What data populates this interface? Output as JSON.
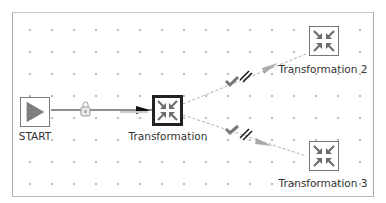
{
  "diagram": {
    "type": "pipeline-flow",
    "colors": {
      "canvas_border": "#b0b0b0",
      "grid_dot": "#b8b8b8",
      "node_border": "#777777",
      "selected_border": "#222222",
      "icon_gray": "#6e6e6e",
      "start_arrow": "#7d7d7d",
      "hop_line": "#222222",
      "hop_dashed": "#b0b0b0",
      "label_text": "#333333"
    },
    "nodes": [
      {
        "id": "start",
        "label": "START",
        "icon": "play-icon",
        "selected": false
      },
      {
        "id": "transformation",
        "label": "Transformation",
        "icon": "collapse-arrows-icon",
        "selected": true
      },
      {
        "id": "transformation2",
        "label": "Transformation 2",
        "icon": "collapse-arrows-icon",
        "selected": false
      },
      {
        "id": "transformation3",
        "label": "Transformation 3",
        "icon": "collapse-arrows-icon",
        "selected": false
      }
    ],
    "hops": [
      {
        "from": "START",
        "to": "Transformation",
        "style": "solid",
        "marker": "lock-icon"
      },
      {
        "from": "Transformation",
        "to": "Transformation 2",
        "style": "dashed",
        "marker": "check-parallel-icon"
      },
      {
        "from": "Transformation",
        "to": "Transformation 3",
        "style": "dashed",
        "marker": "check-parallel-icon"
      }
    ]
  }
}
